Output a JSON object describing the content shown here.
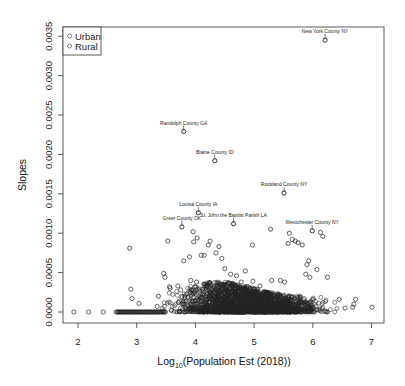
{
  "chart_data": {
    "type": "scatter",
    "title": "",
    "xlabel": "Log10(Population Est (2018))",
    "xlabel_parts": {
      "base": "Log",
      "sub": "10",
      "rest": "(Population Est (2018))"
    },
    "ylabel": "Slopes",
    "xlim": [
      1.75,
      7.2
    ],
    "ylim": [
      -0.0004,
      0.0036
    ],
    "x_ticks": [
      2,
      3,
      4,
      5,
      6,
      7
    ],
    "x_tick_labels": [
      "2",
      "3",
      "4",
      "5",
      "6",
      "7"
    ],
    "y_ticks": [
      0.0,
      0.0005,
      0.001,
      0.0015,
      0.002,
      0.0025,
      0.003,
      0.0035
    ],
    "y_tick_labels": [
      "0.0000",
      "0.0005",
      "0.0010",
      "0.0015",
      "0.0020",
      "0.0025",
      "0.0030",
      "0.0035"
    ],
    "grid": false,
    "legend": {
      "position": "top-left",
      "entries": [
        {
          "label": "Urban",
          "marker": "open-circle",
          "color": "#555555"
        },
        {
          "label": "Rural",
          "marker": "open-circle",
          "color": "#555555"
        }
      ]
    },
    "marker_color": "#222222",
    "annotations": [
      {
        "label": "New York County NY",
        "x": 6.21,
        "y": 0.00345
      },
      {
        "label": "Randolph County GA",
        "x": 3.8,
        "y": 0.00229
      },
      {
        "label": "Blaine County ID",
        "x": 4.33,
        "y": 0.00192
      },
      {
        "label": "Rockland County NY",
        "x": 5.51,
        "y": 0.00151
      },
      {
        "label": "Louisa County IA",
        "x": 4.05,
        "y": 0.00126
      },
      {
        "label": "Greer County OK",
        "x": 3.77,
        "y": 0.00108
      },
      {
        "label": "St. John the Baptist Parish LA",
        "x": 4.65,
        "y": 0.00112
      },
      {
        "label": "Westchester County NY",
        "x": 5.99,
        "y": 0.00103
      }
    ],
    "series": [
      {
        "name": "Counties (outliers)",
        "points": [
          [
            1.93,
            0.0
          ],
          [
            2.18,
            0.0
          ],
          [
            2.43,
            0.0
          ],
          [
            2.88,
            0.00081
          ],
          [
            2.9,
            0.00029
          ],
          [
            2.92,
            0.00017
          ],
          [
            3.04,
            0.00011
          ],
          [
            3.35,
            7e-05
          ],
          [
            3.37,
            0.0002
          ],
          [
            3.46,
            0.00049
          ],
          [
            3.48,
            0.00044
          ],
          [
            3.53,
            0.0009
          ],
          [
            3.56,
            0.00032
          ],
          [
            3.57,
            0.0003
          ],
          [
            3.7,
            0.00033
          ],
          [
            3.75,
            0.00028
          ],
          [
            3.8,
            0.00065
          ],
          [
            3.9,
            0.0007
          ],
          [
            3.92,
            0.0004
          ],
          [
            3.96,
            0.00102
          ],
          [
            3.97,
            0.00089
          ],
          [
            4.03,
            0.00094
          ],
          [
            4.02,
            0.00038
          ],
          [
            4.1,
            0.00072
          ],
          [
            4.15,
            0.00072
          ],
          [
            4.22,
            0.00085
          ],
          [
            4.25,
            0.0009
          ],
          [
            4.35,
            0.00075
          ],
          [
            4.4,
            0.00083
          ],
          [
            4.45,
            0.00068
          ],
          [
            4.5,
            0.00055
          ],
          [
            4.6,
            0.00048
          ],
          [
            4.7,
            0.00046
          ],
          [
            4.78,
            0.00038
          ],
          [
            4.85,
            0.00052
          ],
          [
            4.97,
            0.00085
          ],
          [
            4.98,
            0.00039
          ],
          [
            5.1,
            0.00033
          ],
          [
            5.28,
            0.00105
          ],
          [
            5.3,
            0.0004
          ],
          [
            5.45,
            0.0004
          ],
          [
            5.52,
            0.00038
          ],
          [
            5.58,
            0.00087
          ],
          [
            5.6,
            0.001
          ],
          [
            5.65,
            0.00092
          ],
          [
            5.7,
            0.0009
          ],
          [
            5.75,
            0.00088
          ],
          [
            5.82,
            0.00085
          ],
          [
            5.9,
            0.0006
          ],
          [
            5.93,
            0.00065
          ],
          [
            5.88,
            0.00048
          ],
          [
            5.95,
            0.00044
          ],
          [
            6.07,
            0.00054
          ],
          [
            6.13,
            0.00101
          ],
          [
            6.17,
            0.00096
          ],
          [
            6.25,
            0.00044
          ],
          [
            6.45,
            0.00016
          ],
          [
            6.55,
            5e-05
          ],
          [
            6.68,
            6e-05
          ],
          [
            6.7,
            0.0001
          ],
          [
            6.73,
            0.00016
          ],
          [
            7.01,
            6e-05
          ]
        ]
      },
      {
        "name": "Counties (dense band)",
        "x_range": [
          2.65,
          6.6
        ],
        "y_range": [
          0.0,
          0.0003
        ],
        "note": "~3000 points concentrated near y=0, densest between x=3.5 and 6.0"
      }
    ]
  }
}
